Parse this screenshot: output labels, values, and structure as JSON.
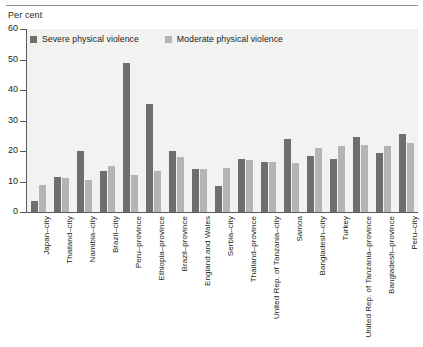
{
  "axis_unit_label": "Per cent",
  "legend": {
    "items": [
      {
        "label": "Severe physical violence",
        "color": "#6e6e6e",
        "key": "severe"
      },
      {
        "label": "Moderate physical violence",
        "color": "#b4b4b4",
        "key": "moderate"
      }
    ]
  },
  "y_ticks": [
    "0",
    "10",
    "20",
    "30",
    "40",
    "50",
    "60"
  ],
  "colors": {
    "severe": "#6e6e6e",
    "moderate": "#b4b4b4",
    "plot_background": "#f2f2f0",
    "axis": "#58595b",
    "text": "#231f20",
    "page_background": "#ffffff"
  },
  "chart_data": {
    "type": "bar",
    "title": "",
    "subtitle": "",
    "xlabel": "",
    "ylabel": "Per cent",
    "ylim": [
      0,
      60
    ],
    "ytick_step": 10,
    "grid": false,
    "legend_position": "top-left inside plot",
    "orientation": "vertical",
    "grouping": "grouped",
    "categories": [
      "Japan–city",
      "Thailand–city",
      "Namibia–city",
      "Brazil–city",
      "Peru–province",
      "Ethiopia–province",
      "Brazil–province",
      "England and Wales",
      "Serbia–city",
      "Thailand–province",
      "United Rep. of Tanzania–city",
      "Samoa",
      "Bangladesh–city",
      "Turkey",
      "United Rep. of Tanzania–province",
      "Bangladesh–province",
      "Peru–city"
    ],
    "series": [
      {
        "name": "Severe physical violence",
        "color": "#6e6e6e",
        "values": [
          3.5,
          11.5,
          20,
          13.5,
          49,
          35.5,
          20,
          14,
          8.5,
          17.5,
          16.5,
          24,
          18.5,
          17.5,
          24.5,
          19.5,
          25.5
        ]
      },
      {
        "name": "Moderate physical violence",
        "color": "#b4b4b4",
        "values": [
          9,
          11,
          10.5,
          15,
          12,
          13.5,
          18,
          14,
          14.5,
          17,
          16.5,
          16,
          21,
          21.5,
          22,
          21.5,
          22.5
        ]
      }
    ]
  }
}
